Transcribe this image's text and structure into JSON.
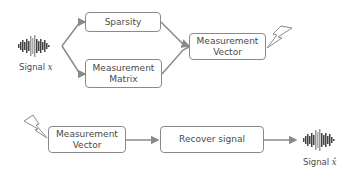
{
  "diagram": {
    "top": {
      "signal_label": "Signal",
      "signal_symbol": "x",
      "sparsity_box": "Sparsity",
      "measurement_matrix_box": {
        "line1": "Measurement",
        "line2": "Matrix"
      },
      "measurement_vector_box": {
        "line1": "Measurement",
        "line2": "Vector"
      },
      "icons": [
        "waveform-icon",
        "lightning-icon"
      ]
    },
    "bottom": {
      "measurement_vector_box": {
        "line1": "Measurement",
        "line2": "Vector"
      },
      "recover_box": "Recover signal",
      "signal_label": "Signal",
      "signal_symbol": "x̂",
      "icons": [
        "lightning-icon",
        "waveform-icon"
      ]
    },
    "colors": {
      "line": "#8a8a8a",
      "text": "#4a4a4a",
      "waveform": "#444444"
    }
  }
}
